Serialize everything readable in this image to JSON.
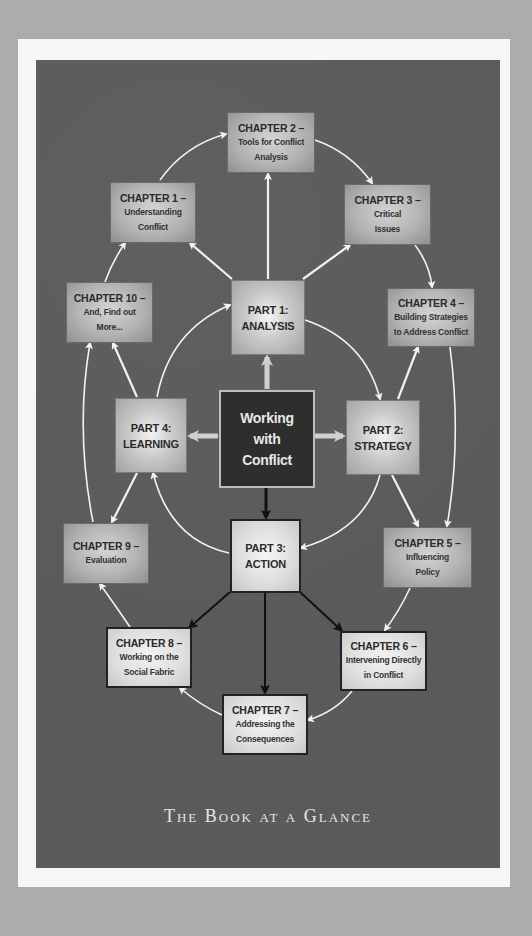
{
  "title": "The Book at a Glance",
  "center": {
    "lines": [
      "Working",
      "with",
      "Conflict"
    ]
  },
  "parts": [
    {
      "id": "part1",
      "lines": [
        "PART 1:",
        "ANALYSIS"
      ]
    },
    {
      "id": "part2",
      "lines": [
        "PART 2:",
        "STRATEGY"
      ]
    },
    {
      "id": "part3",
      "lines": [
        "PART 3:",
        "ACTION"
      ]
    },
    {
      "id": "part4",
      "lines": [
        "PART 4:",
        "LEARNING"
      ]
    }
  ],
  "chapters": [
    {
      "id": "ch1",
      "head": "CHAPTER 1 –",
      "sub": [
        "Understanding",
        "Conflict"
      ]
    },
    {
      "id": "ch2",
      "head": "CHAPTER 2 –",
      "sub": [
        "Tools for Conflict",
        "Analysis"
      ]
    },
    {
      "id": "ch3",
      "head": "CHAPTER 3 –",
      "sub": [
        "Critical",
        "Issues"
      ]
    },
    {
      "id": "ch4",
      "head": "CHAPTER 4 –",
      "sub": [
        "Building Strategies",
        "to Address Conflict"
      ]
    },
    {
      "id": "ch5",
      "head": "CHAPTER 5 –",
      "sub": [
        "Influencing",
        "Policy"
      ]
    },
    {
      "id": "ch6",
      "head": "CHAPTER 6 –",
      "sub": [
        "Intervening Directly",
        "in Conflict"
      ]
    },
    {
      "id": "ch7",
      "head": "CHAPTER 7 –",
      "sub": [
        "Addressing the",
        "Consequences"
      ]
    },
    {
      "id": "ch8",
      "head": "CHAPTER 8 –",
      "sub": [
        "Working on the",
        "Social Fabric"
      ]
    },
    {
      "id": "ch9",
      "head": "CHAPTER 9 –",
      "sub": [
        "Evaluation"
      ]
    },
    {
      "id": "ch10",
      "head": "CHAPTER 10 –",
      "sub": [
        "And, Find out",
        "More..."
      ]
    }
  ],
  "colors": {
    "background": "#acacac",
    "frame": "#f6f6f6",
    "panel": "#5a5a5a",
    "arrow_light": "#f2f2f2",
    "arrow_dark": "#111111",
    "center_fill": "#2e2e2e",
    "title_text": "#e6e6e6"
  }
}
